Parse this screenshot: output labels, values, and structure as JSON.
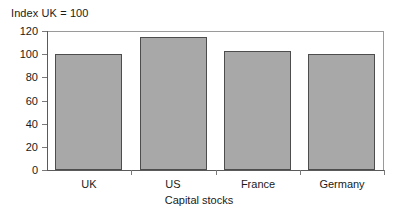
{
  "chart_data": {
    "type": "bar",
    "title": "Index UK = 100",
    "xlabel": "Capital stocks",
    "ylabel": "",
    "categories": [
      "UK",
      "US",
      "France",
      "Germany"
    ],
    "values": [
      100,
      115,
      102.5,
      100
    ],
    "ylim": [
      0,
      120
    ],
    "ytick_step": 20,
    "yticks": [
      0,
      20,
      40,
      60,
      80,
      100,
      120
    ],
    "ytick_labels": [
      "0",
      "20",
      "40",
      "60",
      "80",
      "100",
      "120"
    ],
    "grid": false,
    "legend": null,
    "legend_position": "none",
    "series": [
      {
        "name": "Capital stocks",
        "values": [
          100,
          115,
          102.5,
          100
        ],
        "color": "#a8a8a8",
        "border_color": "#4d4d4d"
      }
    ],
    "annotations": []
  },
  "style": {
    "background": "#ffffff",
    "bar_fill": "#a8a8a8",
    "bar_border": "#4d4d4d",
    "axis_color": "#5a5a5a",
    "frame_color": "#9a9a9a",
    "text_color": "#1a1a1a"
  }
}
